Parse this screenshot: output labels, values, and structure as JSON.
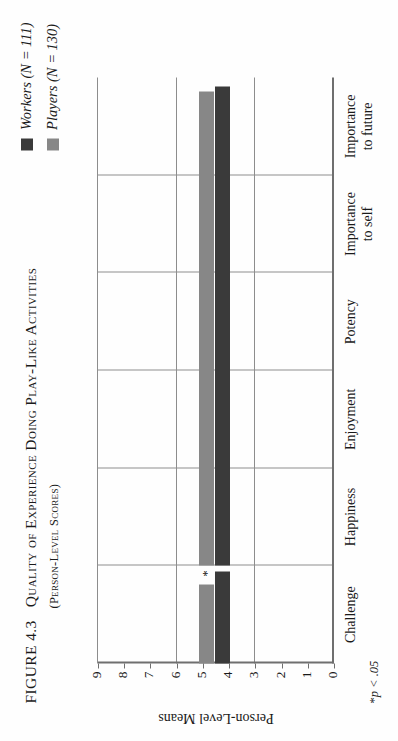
{
  "figure": {
    "number_label": "FIGURE 4.3",
    "title": "Quality of Experience Doing Play-Like Activities",
    "subtitle": "(Person-Level Scores)",
    "footnote_star": "*",
    "footnote_text": "p < .05"
  },
  "legend": {
    "position": "top-right",
    "items": [
      {
        "label": "Workers (N = 111)",
        "name": "Workers",
        "n": 111,
        "color": "#3a3a3a",
        "key": "workers"
      },
      {
        "label": "Players (N = 130)",
        "name": "Players",
        "n": 130,
        "color": "#878787",
        "key": "players"
      }
    ]
  },
  "axes": {
    "ylabel": "Person-Level Means",
    "yticks": [
      "9",
      "8",
      "7",
      "6",
      "5",
      "4",
      "3",
      "2",
      "1",
      "0"
    ],
    "ymin": 0,
    "ymax": 9,
    "gridlines_at": [
      3,
      6,
      9
    ],
    "grid": true
  },
  "annotations": [
    {
      "text": "*",
      "category": "Happiness",
      "series": "players",
      "meaning": "p < .05"
    }
  ],
  "chart_data": {
    "type": "bar",
    "title": "Quality of Experience Doing Play-Like Activities",
    "subtitle": "(Person-Level Scores)",
    "xlabel": "",
    "ylabel": "Person-Level Means",
    "ylim": [
      0,
      9
    ],
    "yticks": [
      0,
      1,
      2,
      3,
      4,
      5,
      6,
      7,
      8,
      9
    ],
    "grid": true,
    "legend_position": "top-right",
    "categories": [
      "Challenge",
      "Happiness",
      "Enjoyment",
      "Potency",
      "Importance\nto self",
      "Importance\nto future"
    ],
    "series": [
      {
        "name": "Workers (N = 111)",
        "color": "#3a3a3a",
        "values": [
          3.5,
          5.8,
          8.2,
          5.3,
          5.3,
          3.4
        ]
      },
      {
        "name": "Players (N = 130)",
        "color": "#878787",
        "values": [
          3.0,
          5.4,
          8.0,
          5.1,
          5.0,
          3.2
        ]
      }
    ],
    "annotations": [
      {
        "text": "*",
        "category": "Happiness",
        "series": "Players (N = 130)"
      }
    ]
  }
}
